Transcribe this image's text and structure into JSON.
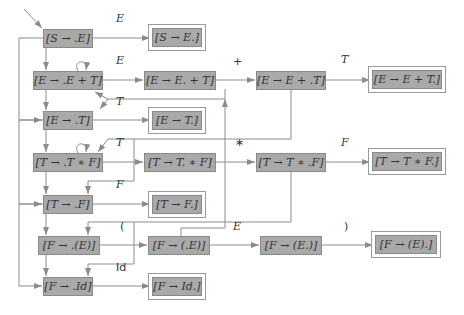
{
  "states": [
    {
      "id": "s0",
      "label": "[S → .E]",
      "x": 43,
      "y": 29,
      "w": 50,
      "h": 19,
      "final": false
    },
    {
      "id": "s1",
      "label": "[S → E.]",
      "x": 152,
      "y": 28,
      "w": 50,
      "h": 19,
      "final": true
    },
    {
      "id": "s2",
      "label": "[E → .E + T]",
      "x": 33,
      "y": 71,
      "w": 70,
      "h": 19,
      "final": false
    },
    {
      "id": "s3",
      "label": "[E → E. + T]",
      "x": 144,
      "y": 71,
      "w": 72,
      "h": 19,
      "final": false
    },
    {
      "id": "s4",
      "label": "[E → E + .T]",
      "x": 256,
      "y": 71,
      "w": 70,
      "h": 19,
      "final": false
    },
    {
      "id": "s5",
      "label": "[E → E + T.]",
      "x": 372,
      "y": 70,
      "w": 70,
      "h": 19,
      "final": true
    },
    {
      "id": "s6",
      "label": "[E → .T]",
      "x": 43,
      "y": 111,
      "w": 50,
      "h": 19,
      "final": false
    },
    {
      "id": "s7",
      "label": "[E → T.]",
      "x": 152,
      "y": 111,
      "w": 50,
      "h": 19,
      "final": true
    },
    {
      "id": "s8",
      "label": "[T → .T ∗ F]",
      "x": 33,
      "y": 153,
      "w": 70,
      "h": 19,
      "final": false
    },
    {
      "id": "s9",
      "label": "[T → T. ∗ F]",
      "x": 144,
      "y": 153,
      "w": 72,
      "h": 19,
      "final": false
    },
    {
      "id": "s10",
      "label": "[T → T ∗ .F]",
      "x": 256,
      "y": 153,
      "w": 70,
      "h": 19,
      "final": false
    },
    {
      "id": "s11",
      "label": "[T → T ∗ F.]",
      "x": 372,
      "y": 152,
      "w": 70,
      "h": 19,
      "final": true
    },
    {
      "id": "s12",
      "label": "[T → .F]",
      "x": 43,
      "y": 195,
      "w": 50,
      "h": 19,
      "final": false
    },
    {
      "id": "s13",
      "label": "[T → F.]",
      "x": 152,
      "y": 195,
      "w": 50,
      "h": 19,
      "final": true
    },
    {
      "id": "s14",
      "label": "[F → .(E)]",
      "x": 38,
      "y": 236,
      "w": 62,
      "h": 19,
      "final": false
    },
    {
      "id": "s15",
      "label": "[F → (.E)]",
      "x": 148,
      "y": 236,
      "w": 62,
      "h": 19,
      "final": false
    },
    {
      "id": "s16",
      "label": "[F → (E.)]",
      "x": 260,
      "y": 236,
      "w": 62,
      "h": 19,
      "final": false
    },
    {
      "id": "s17",
      "label": "[F → (E).]",
      "x": 375,
      "y": 235,
      "w": 62,
      "h": 19,
      "final": true
    },
    {
      "id": "s18",
      "label": "[F → .Id]",
      "x": 43,
      "y": 277,
      "w": 50,
      "h": 19,
      "final": false
    },
    {
      "id": "s19",
      "label": "[F → Id.]",
      "x": 152,
      "y": 277,
      "w": 50,
      "h": 19,
      "final": true
    }
  ],
  "edge_labels": [
    {
      "text": "E",
      "x": 116,
      "y": 24,
      "roman": false
    },
    {
      "text": "E",
      "x": 116,
      "y": 66,
      "roman": false
    },
    {
      "text": "+",
      "x": 233,
      "y": 67,
      "roman": true
    },
    {
      "text": "T",
      "x": 341,
      "y": 65,
      "roman": false
    },
    {
      "text": "T",
      "x": 116,
      "y": 107,
      "roman": false
    },
    {
      "text": "T",
      "x": 116,
      "y": 148,
      "roman": false
    },
    {
      "text": "∗",
      "x": 235,
      "y": 148,
      "roman": true
    },
    {
      "text": "F",
      "x": 341,
      "y": 148,
      "roman": false
    },
    {
      "text": "F",
      "x": 116,
      "y": 190,
      "roman": false
    },
    {
      "text": "(",
      "x": 120,
      "y": 232,
      "roman": true
    },
    {
      "text": "E",
      "x": 233,
      "y": 232,
      "roman": false
    },
    {
      "text": ")",
      "x": 344,
      "y": 232,
      "roman": true
    },
    {
      "text": "Id",
      "x": 116,
      "y": 273,
      "roman": true
    }
  ],
  "colors": {
    "state_fill": "#a9a9a9",
    "line": "#8c8c8c",
    "text": "#333333"
  }
}
